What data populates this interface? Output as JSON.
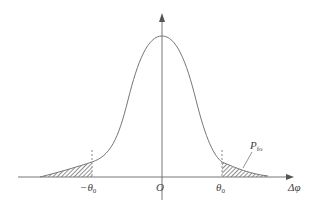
{
  "diagram": {
    "type": "distribution-curve",
    "labels": {
      "origin": "O",
      "x_axis": "Δφ",
      "left_threshold": "−θ",
      "left_threshold_sub": "0",
      "right_threshold": "θ",
      "right_threshold_sub": "0",
      "tail_prob": "P",
      "tail_prob_sub": "fo"
    }
  }
}
